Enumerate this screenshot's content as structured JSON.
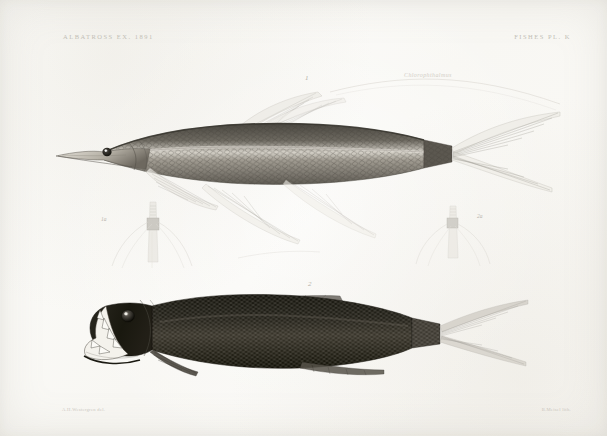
{
  "plate": {
    "header_left": "ALBATROSS EX. 1891",
    "header_right": "FISHES PL. K",
    "credit_left": "A.H.Westergren del.",
    "credit_right": "B.Meisel lith.",
    "script_note": "Chlorophthalmus",
    "background_color": "#fbfbf9",
    "ink_color": "#2e2c28"
  },
  "figures": [
    {
      "number": "1",
      "name": "upper-fish",
      "description": "elongate pale lizardfish in left-facing lateral view with long filamentous caudal rays",
      "label_x": 305,
      "label_y": 78
    },
    {
      "number": "2",
      "name": "lower-fish",
      "description": "dark deep-bodied fish in left-facing lateral view with large fang teeth",
      "label_x": 308,
      "label_y": 284
    }
  ],
  "detail_figures": [
    {
      "number": "1a",
      "name": "upper-fish-anterior-detail",
      "description": "anterior ventral view of figure 1 head region",
      "label_x": 103,
      "label_y": 219
    },
    {
      "number": "2a",
      "name": "lower-fish-anterior-detail",
      "description": "anterior ventral view of figure 2 head region",
      "label_x": 478,
      "label_y": 216
    }
  ]
}
